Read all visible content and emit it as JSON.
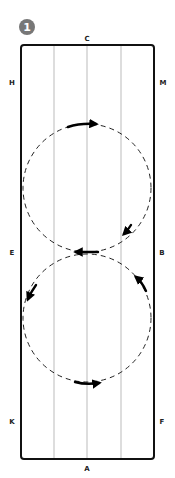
{
  "figure": {
    "step_number": "1",
    "badge_color": "#777777"
  },
  "arena": {
    "letters": {
      "top": "C",
      "bottom": "A",
      "left_upper": "H",
      "left_middle": "E",
      "left_lower": "K",
      "right_upper": "M",
      "right_middle": "B",
      "right_lower": "F"
    },
    "border_color": "#111111",
    "quarter_line_color": "#aaaaaa"
  },
  "figure_eight": {
    "circles": [
      {
        "name": "upper-circle",
        "cx": 87,
        "cy": 188,
        "r": 64
      },
      {
        "name": "lower-circle",
        "cx": 87,
        "cy": 318,
        "r": 64
      }
    ],
    "direction_arrows": [
      {
        "name": "top-arrow",
        "direction": "right"
      },
      {
        "name": "upper-right-arrow",
        "direction": "down-left"
      },
      {
        "name": "center-arrow",
        "direction": "left"
      },
      {
        "name": "lower-left-arrow",
        "direction": "down-left"
      },
      {
        "name": "lower-right-arrow",
        "direction": "up-left"
      },
      {
        "name": "bottom-arrow",
        "direction": "right"
      }
    ]
  }
}
